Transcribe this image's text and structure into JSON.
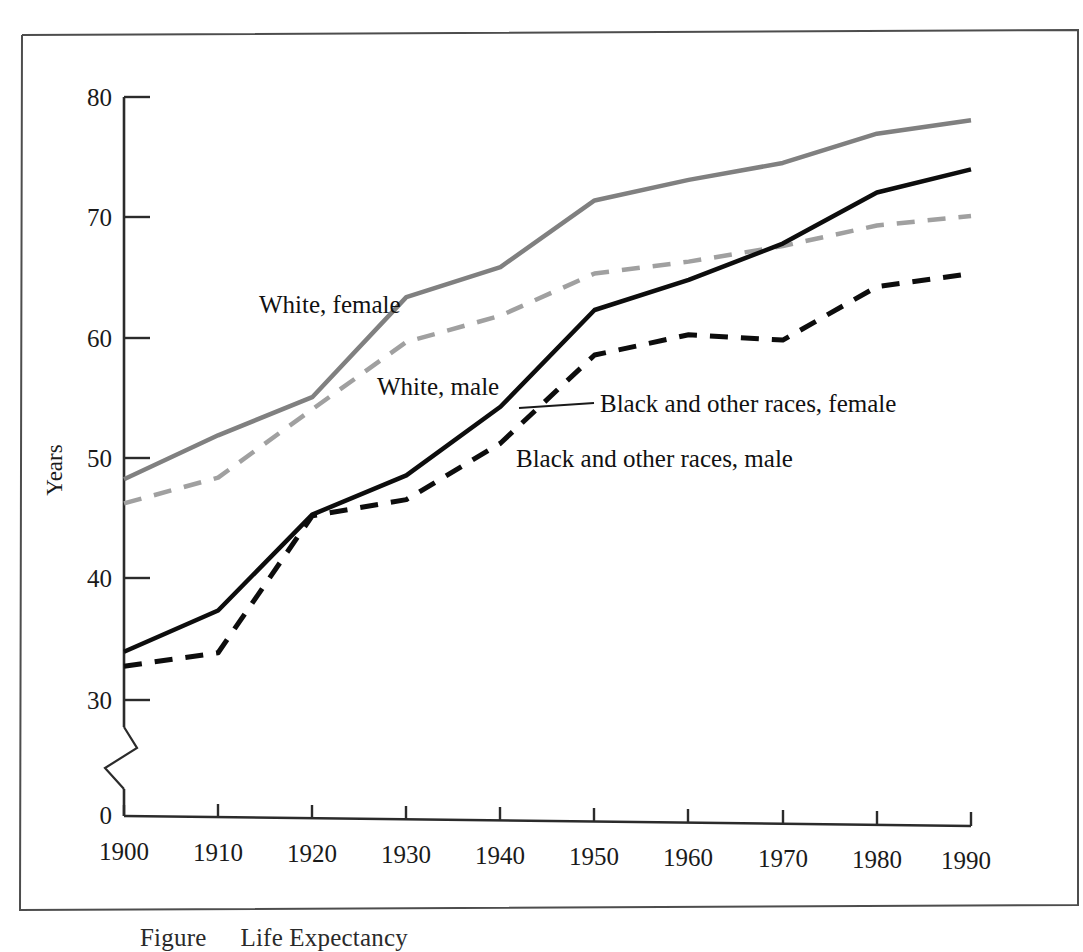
{
  "figure": {
    "caption_prefix": "Figure",
    "caption_number": "",
    "caption_text": "Life Expectancy",
    "border_color": "#555555",
    "background": "#ffffff"
  },
  "chart_data": {
    "type": "line",
    "title": "",
    "xlabel": "",
    "ylabel": "Years",
    "x": [
      1900,
      1910,
      1920,
      1930,
      1940,
      1950,
      1960,
      1970,
      1980,
      1990
    ],
    "xlim": [
      1900,
      1990
    ],
    "ylim": [
      30,
      80
    ],
    "y_axis_break": true,
    "y_break_from": 0,
    "y_break_to": 30,
    "yticks": [
      0,
      30,
      40,
      50,
      60,
      70,
      80
    ],
    "ytick_labels": [
      "0",
      "30",
      "40",
      "50",
      "60",
      "70",
      "80"
    ],
    "xticks": [
      1900,
      1910,
      1920,
      1930,
      1940,
      1950,
      1960,
      1970,
      1980,
      1990
    ],
    "xtick_labels": [
      "1900",
      "1910",
      "1920",
      "1930",
      "1940",
      "1950",
      "1960",
      "1970",
      "1980",
      "1990"
    ],
    "grid": false,
    "legend": "inline-labels",
    "series": [
      {
        "name": "White, female",
        "label": "White, female",
        "color": "#808080",
        "style": "solid",
        "width": 4.5,
        "values": [
          48.3,
          52.0,
          55.2,
          63.5,
          66.0,
          71.5,
          73.2,
          74.6,
          77.0,
          78.1
        ]
      },
      {
        "name": "White, male",
        "label": "White, male",
        "color": "#a0a0a0",
        "style": "dashed",
        "width": 4.5,
        "values": [
          46.3,
          48.5,
          54.2,
          59.8,
          62.0,
          65.5,
          66.5,
          67.8,
          69.5,
          70.3
        ]
      },
      {
        "name": "Black and other races, female",
        "label": "Black and other races, female",
        "color": "#0d0d0d",
        "style": "solid",
        "width": 4.5,
        "values": [
          34.0,
          37.5,
          45.5,
          48.8,
          54.5,
          62.5,
          65.0,
          68.0,
          72.2,
          74.1
        ]
      },
      {
        "name": "Black and other races, male",
        "label": "Black and other races, male",
        "color": "#0d0d0d",
        "style": "dashed",
        "width": 5.0,
        "values": [
          32.8,
          34.0,
          45.4,
          46.8,
          51.5,
          58.8,
          60.5,
          60.1,
          64.5,
          65.6
        ]
      }
    ],
    "annotations": [
      {
        "text": "White, female",
        "x": 1908.5,
        "y": 62.2
      },
      {
        "text": "White, male",
        "x": 1921.5,
        "y": 55.8
      },
      {
        "text": "Black and other races, female",
        "x": 1943.5,
        "y": 54.4,
        "leader": true
      },
      {
        "text": "Black and other races, male",
        "x": 1938.0,
        "y": 50.6
      }
    ]
  }
}
